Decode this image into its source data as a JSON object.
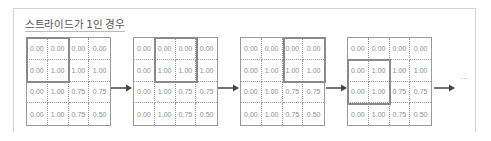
{
  "title": "스트라이드가 1인 경우",
  "matrix": [
    [
      "0.00",
      "0.00",
      "0.00",
      "0.00"
    ],
    [
      "0.00",
      "1.00",
      "1.00",
      "1.00"
    ],
    [
      "0.00",
      "1.00",
      "0.75",
      "0.75"
    ],
    [
      "0.00",
      "1.00",
      "0.75",
      "0.50"
    ]
  ],
  "steps": [
    {
      "window_row": 0,
      "window_col": 0
    },
    {
      "window_row": 0,
      "window_col": 1
    },
    {
      "window_row": 0,
      "window_col": 2
    },
    {
      "window_row": 1,
      "window_col": 0
    }
  ],
  "window_size": 2,
  "stride": 1,
  "ellipsis": "···",
  "colors": {
    "grid_border": "#9a9a9a",
    "highlight_border": "#8a8a8a",
    "arrow": "#444444",
    "text": "#8f8f8f"
  }
}
